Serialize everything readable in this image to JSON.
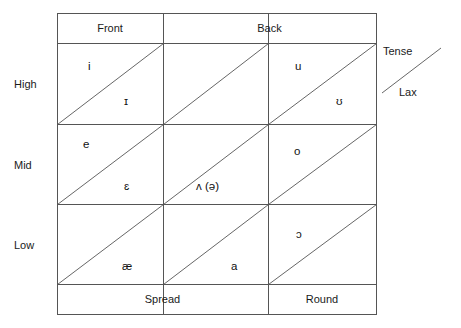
{
  "figure": {
    "kind": "vowel-quadrilateral-grid",
    "line_color": "#555555",
    "text_color": "#111111",
    "background": "#ffffff"
  },
  "columns": {
    "headers": [
      {
        "label": "Front",
        "span": 1
      },
      {
        "label": "Back",
        "span": 2
      }
    ],
    "footers": [
      {
        "label": "Spread",
        "span": 2
      },
      {
        "label": "Round",
        "span": 1
      }
    ]
  },
  "rows": {
    "labels": [
      "High",
      "Mid",
      "Low"
    ]
  },
  "legend": {
    "tense_label": "Tense",
    "lax_label": "Lax"
  },
  "cells": [
    {
      "row": "High",
      "column": "Front",
      "tense": "i",
      "lax": "ɪ"
    },
    {
      "row": "High",
      "column": "Central",
      "tense": "",
      "lax": ""
    },
    {
      "row": "High",
      "column": "Back",
      "tense": "u",
      "lax": "ʊ"
    },
    {
      "row": "Mid",
      "column": "Front",
      "tense": "e",
      "lax": "ɛ"
    },
    {
      "row": "Mid",
      "column": "Central",
      "tense": "",
      "lax": "ʌ (ə)"
    },
    {
      "row": "Mid",
      "column": "Back",
      "tense": "o",
      "lax": ""
    },
    {
      "row": "Low",
      "column": "Front",
      "tense": "",
      "lax": "æ"
    },
    {
      "row": "Low",
      "column": "Central",
      "tense": "",
      "lax": "a"
    },
    {
      "row": "Low",
      "column": "Back",
      "tense": "ɔ",
      "lax": ""
    }
  ]
}
